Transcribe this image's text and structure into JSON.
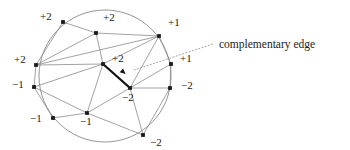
{
  "figure": {
    "cropped_heading": "a 2 2 alternating statement",
    "annotation": {
      "label": "complementary edge",
      "leader_style": "dotted"
    },
    "colors": {
      "ink": "#1a1a1a",
      "circle_stroke": "#7a7a7a",
      "edge_stroke": "#8a8a8a",
      "highlight_stroke": "#111111",
      "background": "#ffffff"
    },
    "circle": {
      "cx": 105,
      "cy": 76,
      "r": 66
    },
    "vertices": [
      {
        "id": "v_top_left",
        "label": "+2",
        "x": 63,
        "y": 22,
        "label_x": 40,
        "label_y": 20
      },
      {
        "id": "v_top_mid",
        "label": "+2",
        "x": 96,
        "y": 33,
        "label_x": 103,
        "label_y": 21
      },
      {
        "id": "v_top_right",
        "label": "+1",
        "x": 159,
        "y": 36,
        "label_x": 168,
        "label_y": 26
      },
      {
        "id": "v_left_upper",
        "label": "+2",
        "x": 36,
        "y": 65,
        "label_x": 14,
        "label_y": 63
      },
      {
        "id": "v_center",
        "label": "+2",
        "x": 103,
        "y": 64,
        "label_x": 112,
        "label_y": 62
      },
      {
        "id": "v_right_upper",
        "label": "+1",
        "x": 171,
        "y": 64,
        "label_x": 180,
        "label_y": 62
      },
      {
        "id": "v_left_lower",
        "label": "-1",
        "x": 34,
        "y": 87,
        "label_x": 12,
        "label_y": 88
      },
      {
        "id": "v_inner_right",
        "label": "-2",
        "x": 130,
        "y": 88,
        "label_x": 122,
        "label_y": 101
      },
      {
        "id": "v_right_lower",
        "label": "-2",
        "x": 170,
        "y": 88,
        "label_x": 181,
        "label_y": 89
      },
      {
        "id": "v_bot_left",
        "label": "-1",
        "x": 53,
        "y": 118,
        "label_x": 30,
        "label_y": 122
      },
      {
        "id": "v_bot_mid",
        "label": "-1",
        "x": 87,
        "y": 113,
        "label_x": 80,
        "label_y": 125
      },
      {
        "id": "v_bot_right",
        "label": "-2",
        "x": 143,
        "y": 135,
        "label_x": 150,
        "label_y": 146
      }
    ],
    "edges": [
      [
        "v_top_left",
        "v_top_mid"
      ],
      [
        "v_top_left",
        "v_left_upper"
      ],
      [
        "v_top_mid",
        "v_top_right"
      ],
      [
        "v_top_mid",
        "v_center"
      ],
      [
        "v_top_mid",
        "v_left_upper"
      ],
      [
        "v_top_right",
        "v_center"
      ],
      [
        "v_top_right",
        "v_left_upper"
      ],
      [
        "v_top_right",
        "v_right_upper"
      ],
      [
        "v_top_right",
        "v_inner_right"
      ],
      [
        "v_left_upper",
        "v_center"
      ],
      [
        "v_left_upper",
        "v_left_lower"
      ],
      [
        "v_center",
        "v_left_lower"
      ],
      [
        "v_center",
        "v_bot_mid"
      ],
      [
        "v_right_upper",
        "v_inner_right"
      ],
      [
        "v_right_upper",
        "v_right_lower"
      ],
      [
        "v_inner_right",
        "v_right_lower"
      ],
      [
        "v_inner_right",
        "v_bot_mid"
      ],
      [
        "v_inner_right",
        "v_bot_right"
      ],
      [
        "v_left_lower",
        "v_bot_left"
      ],
      [
        "v_left_lower",
        "v_bot_mid"
      ],
      [
        "v_bot_left",
        "v_bot_mid"
      ],
      [
        "v_bot_mid",
        "v_bot_right"
      ],
      [
        "v_right_lower",
        "v_bot_right"
      ]
    ],
    "highlighted_edge": {
      "from": "v_center",
      "to": "v_inner_right"
    },
    "leader": {
      "x1": 134,
      "y1": 70,
      "x2": 213,
      "y2": 44
    }
  }
}
